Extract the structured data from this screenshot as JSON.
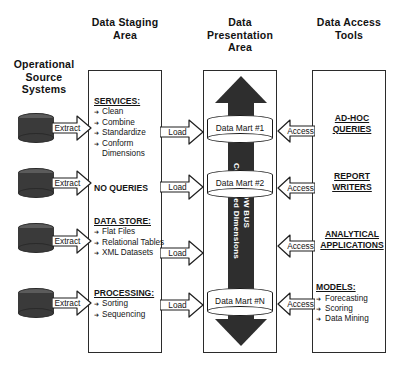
{
  "diagram": {
    "headers": {
      "source": "Operational\nSource\nSystems",
      "source_lines": [
        "Operational",
        "Source",
        "Systems"
      ],
      "staging": "Data Staging Area",
      "staging_lines": [
        "Data Staging",
        "Area"
      ],
      "presentation": "Data Presentation Area",
      "presentation_lines": [
        "Data",
        "Presentation",
        "Area"
      ],
      "access": "Data Access Tools",
      "access_lines": [
        "Data  Access",
        "Tools"
      ]
    },
    "source_systems": [
      {
        "label": "",
        "arrow_label": "Extract"
      },
      {
        "label": "",
        "arrow_label": "Extract"
      },
      {
        "label": "",
        "arrow_label": "Extract"
      },
      {
        "label": "",
        "arrow_label": "Extract"
      }
    ],
    "staging_blocks": [
      {
        "heading": "SERVICES:",
        "underlined": true,
        "items": [
          "Clean",
          "Combine",
          "Standardize",
          "Conform"
        ],
        "continuation": "Dimensions",
        "arrow_label": "Load"
      },
      {
        "heading": "NO QUERIES",
        "underlined": false,
        "items": [],
        "continuation": "",
        "arrow_label": "Load"
      },
      {
        "heading": "DATA STORE:",
        "underlined": true,
        "items": [
          "Flat Files",
          "Relational Tables",
          "XML Datasets"
        ],
        "continuation": "",
        "arrow_label": "Load"
      },
      {
        "heading": "PROCESSING:",
        "underlined": true,
        "items": [
          "Sorting",
          "Sequencing"
        ],
        "continuation": "",
        "arrow_label": "Load"
      }
    ],
    "presentation": {
      "bus_label_line1": "DW BUS",
      "bus_label_line2": "Conformed Dimensions",
      "bus_label": "DW BUS Conformed Dimensions",
      "data_marts": [
        {
          "label": "Data Mart #1"
        },
        {
          "label": "Data Mart #2"
        },
        {
          "label": "Data Mart #N"
        }
      ]
    },
    "access_tools": [
      {
        "heading_lines": [
          "AD-HOC",
          "QUERIES"
        ],
        "items": [],
        "arrow_label": "Access"
      },
      {
        "heading_lines": [
          "REPORT",
          "WRITERS"
        ],
        "items": [],
        "arrow_label": "Access"
      },
      {
        "heading_lines": [
          "ANALYTICAL",
          "APPLICATIONS"
        ],
        "items": [],
        "arrow_label": "Access"
      },
      {
        "heading_lines": [
          "MODELS:"
        ],
        "items": [
          "Forecasting",
          "Scoring",
          "Data Mining"
        ],
        "arrow_label": "Access"
      }
    ],
    "colors": {
      "bus_fill": "#2e2e2e",
      "source_cylinder": "#3a3a3a",
      "source_cylinder_top": "#5b5b5b",
      "panel_border": "#2b2b2b",
      "text": "#141414",
      "background": "#ffffff"
    }
  }
}
